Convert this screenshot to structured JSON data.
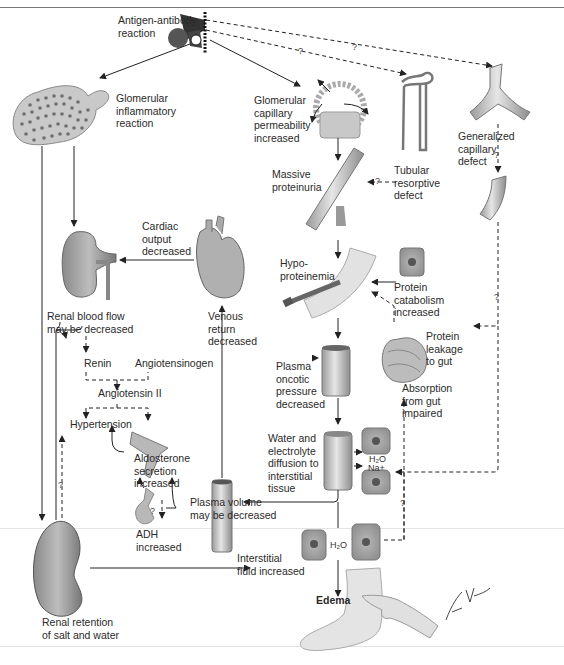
{
  "nodes": {
    "antigen": "Antigen-antibody\nreaction",
    "glom_inflam": "Glomerular\ninflammatory\nreaction",
    "glom_perm": "Glomerular\ncapillary\npermeability\nincreased",
    "tubular": "Tubular\nresorptive\ndefect",
    "gen_cap": "Generalized\ncapillary\ndefect",
    "proteinuria": "Massive\nproteinuria",
    "cardiac": "Cardiac\noutput\ndecreased",
    "hypoprot": "Hypo-\nproteinemia",
    "catabolism": "Protein\ncatabolism\nincreased",
    "renal_flow": "Renal blood flow\nmay be decreased",
    "venous": "Venous\nreturn\ndecreased",
    "leakage": "Protein\nleakage\nto gut",
    "renin": "Renin",
    "angiotensinogen": "Angiotensinogen",
    "angiotensin2": "Angiotensin II",
    "plasma_onc": "Plasma\noncotic\npressure\ndecreased",
    "absorption": "Absorption\nfrom gut\nimpaired",
    "hypertension": "Hypertension",
    "aldosterone": "Aldosterone\nsecretion\nincreased",
    "water_elec": "Water and\nelectrolyte\ndiffusion to\ninterstitial\ntissue",
    "plasma_vol": "Plasma volume\nmay be decreased",
    "adh": "ADH\nincreased",
    "interstitial": "Interstitial\nfluid increased",
    "renal_ret": "Renal retention\nof salt and water",
    "edema": "Edema"
  },
  "chem": {
    "h2o": "H₂O",
    "na": "Na+",
    "h2o_lower": "H₂O"
  },
  "uncertain_mark": "?",
  "signature": "F. Netter M.D."
}
